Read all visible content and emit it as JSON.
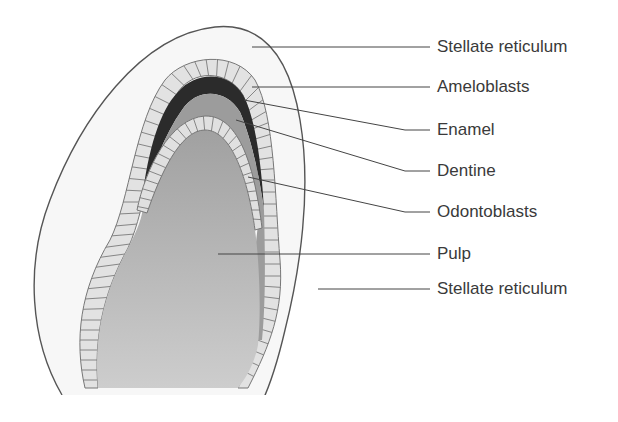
{
  "diagram": {
    "type": "anatomical-cross-section",
    "colors": {
      "outline": "#555555",
      "stellate_reticulum": "#f7f7f7",
      "ameloblasts": "#e2e2e2",
      "cell_lines": "#7a7a7a",
      "enamel": "#2b2b2b",
      "dentine": "#9c9c9c",
      "odontoblasts": "#e0e0e0",
      "pulp_top": "#a2a2a2",
      "pulp_bottom": "#cbcbcb",
      "leader": "#444444",
      "label_text": "#3a3a3a"
    },
    "labels": [
      {
        "id": "stellate-reticulum-top",
        "text": "Stellate reticulum",
        "y": 47
      },
      {
        "id": "ameloblasts",
        "text": "Ameloblasts",
        "y": 87
      },
      {
        "id": "enamel",
        "text": "Enamel",
        "y": 130
      },
      {
        "id": "dentine",
        "text": "Dentine",
        "y": 171
      },
      {
        "id": "odontoblasts",
        "text": "Odontoblasts",
        "y": 212
      },
      {
        "id": "pulp",
        "text": "Pulp",
        "y": 254
      },
      {
        "id": "stellate-reticulum-bottom",
        "text": "Stellate reticulum",
        "y": 289
      }
    ]
  }
}
